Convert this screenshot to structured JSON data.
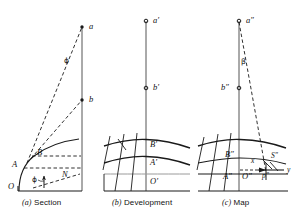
{
  "figure": {
    "kind": "technical-diagram",
    "title_parts": [
      "(a) Section",
      "(b) Development",
      "(c) Map"
    ],
    "ink_color": "#1a1a1a",
    "paper_color": "#ffffff",
    "width": 305,
    "height": 212
  },
  "panels": [
    {
      "id": "section",
      "caption_index": "(a)",
      "caption_text": "Section",
      "labels": {
        "point_a": "a",
        "point_b": "b",
        "point_A": "A",
        "point_B": "B",
        "point_O": "O",
        "point_N": "N",
        "angle_upper": "ϕ",
        "angle_lower": "ϕ"
      }
    },
    {
      "id": "development",
      "caption_index": "(b)",
      "caption_text": "Development",
      "labels": {
        "point_a": "a′",
        "point_b": "b′",
        "point_A": "A′",
        "point_B": "B′",
        "point_O": "O′"
      }
    },
    {
      "id": "map",
      "caption_index": "(c)",
      "caption_text": "Map",
      "labels": {
        "point_a": "a″",
        "point_b": "b″",
        "point_A": "A″",
        "point_B": "B″",
        "point_O": "O″",
        "point_S": "S″",
        "point_p": "p″",
        "offset_x": "x",
        "offset_y": "y",
        "angle_beta": "β"
      }
    }
  ]
}
